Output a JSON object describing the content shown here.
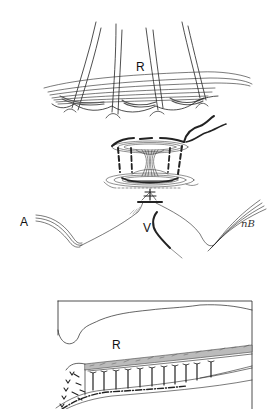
{
  "figure": {
    "panel_top": {
      "labels": {
        "retina": "R",
        "artery": "A",
        "vein": "V"
      },
      "signature": "nB"
    },
    "panel_bottom": {
      "labels": {
        "retina": "R"
      }
    },
    "colors": {
      "line": "#222222",
      "background": "#ffffff"
    }
  }
}
